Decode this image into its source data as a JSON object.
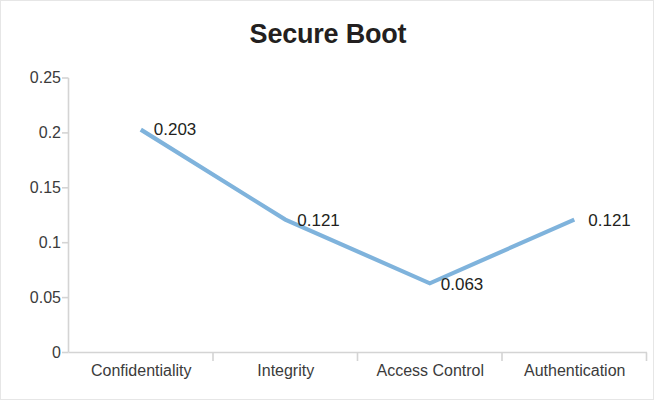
{
  "chart_data": {
    "type": "line",
    "title": "Secure Boot",
    "xlabel": "",
    "ylabel": "",
    "categories": [
      "Confidentiality",
      "Integrity",
      "Access Control",
      "Authentication"
    ],
    "values": [
      0.203,
      0.121,
      0.063,
      0.121
    ],
    "data_labels": [
      "0.203",
      "0.121",
      "0.063",
      "0.121"
    ],
    "series": [
      {
        "name": "Secure Boot",
        "values": [
          0.203,
          0.121,
          0.063,
          0.121
        ],
        "color": "#7FB3DC"
      }
    ],
    "ylim": [
      0,
      0.25
    ],
    "yticks": [
      0.25,
      0.2,
      0.15,
      0.1,
      0.05,
      0
    ],
    "ytick_labels": [
      "0.25",
      "0.2",
      "0.15",
      "0.1",
      "0.05",
      "0"
    ],
    "grid": false,
    "legend": "none",
    "axis_color": "#d4d4d4",
    "text_color": "#3b3b3b",
    "title_color": "#231f20",
    "background": "#ffffff"
  }
}
